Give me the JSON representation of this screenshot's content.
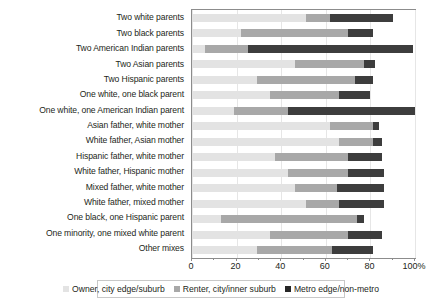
{
  "chart_data": {
    "type": "bar",
    "orientation": "horizontal",
    "stacked": true,
    "title": "",
    "xlabel": "",
    "ylabel": "",
    "xlim": [
      0,
      100
    ],
    "xticks": [
      0,
      20,
      40,
      60,
      80,
      100
    ],
    "xtick_labels": [
      "0",
      "20",
      "40",
      "60",
      "80",
      "100%"
    ],
    "grid": true,
    "legend_position": "bottom",
    "categories": [
      "Two white parents",
      "Two black parents",
      "Two American Indian parents",
      "Two Asian parents",
      "Two Hispanic parents",
      "One white, one black parent",
      "One white, one American Indian parent",
      "Asian father, white mother",
      "White father, Asian mother",
      "Hispanic father, white mother",
      "White father, Hispanic mother",
      "Mixed father, white mother",
      "White father, mixed mother",
      "One black, one Hispanic parent",
      "One minority, one mixed white parent",
      "Other mixes"
    ],
    "series": [
      {
        "name": "Owner, city edge/suburb",
        "color": "#e3e3e3",
        "values": [
          51,
          22,
          6,
          46,
          29,
          35,
          19,
          62,
          66,
          37,
          43,
          46,
          51,
          13,
          35,
          29
        ]
      },
      {
        "name": "Renter, city/inner suburb",
        "color": "#a8a8a8",
        "values": [
          11,
          48,
          19,
          31,
          44,
          31,
          24,
          19,
          15,
          33,
          27,
          19,
          15,
          61,
          35,
          34
        ]
      },
      {
        "name": "Metro edge/non-metro",
        "color": "#3d3d3d",
        "values": [
          28,
          11,
          74,
          5,
          8,
          14,
          57,
          3,
          4,
          15,
          16,
          21,
          20,
          3,
          15,
          18
        ]
      }
    ]
  },
  "legend": {
    "items": [
      {
        "label": "Owner, city edge/suburb"
      },
      {
        "label": "Renter, city/inner suburb"
      },
      {
        "label": "Metro edge/non-metro"
      }
    ]
  }
}
